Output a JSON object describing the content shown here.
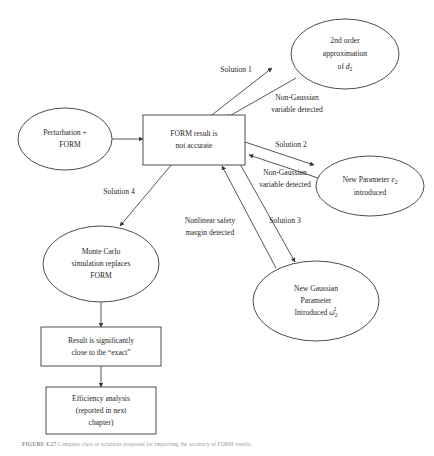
{
  "figure": {
    "caption_label": "FIGURE 4.27",
    "caption_text": "Complete class of solutions proposed for improving the accuracy of FORM results."
  },
  "diagram": {
    "type": "flowchart",
    "nodes": [
      {
        "id": "perturbation-form",
        "shape": "ellipse",
        "lines": [
          "Perturbation +",
          "FORM"
        ]
      },
      {
        "id": "form-result",
        "shape": "rect",
        "lines": [
          "FORM result is",
          "not accurate"
        ]
      },
      {
        "id": "second-order",
        "shape": "ellipse",
        "lines": [
          "2nd order",
          "approximation",
          "of d2"
        ],
        "line3_prefix": "of ",
        "line3_var": "d",
        "line3_sub": "2"
      },
      {
        "id": "new-parameter",
        "shape": "ellipse",
        "lines": [
          "New Parameter e2",
          "introduced"
        ],
        "line1_prefix": "New Parameter ",
        "line1_var": "e",
        "line1_sub": "2"
      },
      {
        "id": "new-gaussian",
        "shape": "ellipse",
        "lines": [
          "New Gaussian",
          "Parameter",
          "Introduced w2^2"
        ],
        "line3_prefix": "Introduced ",
        "line3_var": "ω",
        "line3_sub": "2",
        "line3_sup": "2"
      },
      {
        "id": "monte-carlo",
        "shape": "ellipse",
        "lines": [
          "Monte Carlo",
          "simulation replaces",
          "FORM"
        ]
      },
      {
        "id": "result-close",
        "shape": "rect",
        "lines": [
          "Result is significantly",
          "close to the “exact”"
        ]
      },
      {
        "id": "efficiency",
        "shape": "rect",
        "lines": [
          "Efficiency analysis",
          "(reported in next",
          "chapter)"
        ]
      }
    ],
    "edge_labels": [
      {
        "id": "solution-1",
        "text": "Solution 1"
      },
      {
        "id": "non-gaussian-1",
        "lines": [
          "Non-Gaussian",
          "variable detected"
        ]
      },
      {
        "id": "solution-2",
        "text": "Solution 2"
      },
      {
        "id": "non-gaussian-2",
        "lines": [
          "Non-Gaussian",
          "variable detected"
        ]
      },
      {
        "id": "solution-3",
        "text": "Solution 3"
      },
      {
        "id": "nonlinear-safety",
        "lines": [
          "Nonlinear safety",
          "margin detected"
        ]
      },
      {
        "id": "solution-4",
        "text": "Solution 4"
      }
    ]
  },
  "labels": {
    "perturbation_line1": "Perturbation +",
    "perturbation_line2": "FORM",
    "form_result_line1": "FORM result is",
    "form_result_line2": "not accurate",
    "second_order_line1": "2nd order",
    "second_order_line2": "approximation",
    "second_order_line3_prefix": "of ",
    "second_order_var": "d",
    "second_order_sub": "2",
    "new_parameter_line1_prefix": "New Parameter ",
    "new_parameter_var": "e",
    "new_parameter_sub": "2",
    "new_parameter_line2": "introduced",
    "new_gaussian_line1": "New Gaussian",
    "new_gaussian_line2": "Parameter",
    "new_gaussian_line3_prefix": "Introduced ",
    "new_gaussian_var": "ω",
    "new_gaussian_sub": "2",
    "new_gaussian_sup": "2",
    "monte_carlo_line1": "Monte Carlo",
    "monte_carlo_line2": "simulation replaces",
    "monte_carlo_line3": "FORM",
    "result_close_line1": "Result is significantly",
    "result_close_line2": "close to the “exact”",
    "efficiency_line1": "Efficiency analysis",
    "efficiency_line2": "(reported in next",
    "efficiency_line3": "chapter)",
    "solution_1": "Solution 1",
    "solution_2": "Solution 2",
    "solution_3": "Solution 3",
    "solution_4": "Solution 4",
    "non_gaussian_a1": "Non-Gaussian",
    "non_gaussian_a2": "variable detected",
    "non_gaussian_b1": "Non-Gaussian",
    "non_gaussian_b2": "variable detected",
    "nonlinear_1": "Nonlinear safety",
    "nonlinear_2": "margin detected"
  },
  "colors": {
    "stroke": "#3a3a3a",
    "text": "#1f1f1f",
    "background": "#ffffff",
    "caption": "#9a9a9a"
  }
}
